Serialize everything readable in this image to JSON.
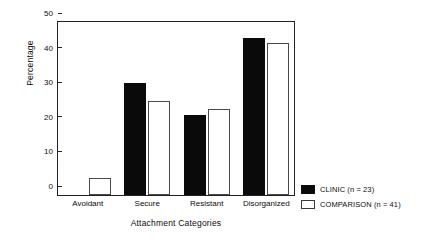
{
  "chart_data": {
    "type": "bar",
    "title": "",
    "xlabel": "Attachment Categories",
    "ylabel": "Percentage",
    "categories": [
      "Avoidant",
      "Secure",
      "Resistant",
      "Disorganized"
    ],
    "series": [
      {
        "name": "CLINIC (n = 23)",
        "color": "#0a0a0a",
        "fill": "solid",
        "values": [
          0,
          32,
          23,
          45
        ]
      },
      {
        "name": "COMPARISON (n = 41)",
        "color": "#ffffff",
        "fill": "open",
        "values": [
          5,
          27,
          24.5,
          43.5
        ]
      }
    ],
    "ylim": [
      0,
      50
    ],
    "yticks": [
      0,
      10,
      20,
      30,
      40,
      50
    ],
    "ytick_labels": [
      "0",
      "10",
      "20",
      "30",
      "40",
      "50"
    ],
    "grid": false,
    "legend_position": "bottom-right-outside",
    "frame": "box"
  },
  "legend": {
    "entries": [
      {
        "label": "CLINIC (n = 23)",
        "swatch": "filled-black-square"
      },
      {
        "label": "COMPARISON (n = 41)",
        "swatch": "open-white-square"
      }
    ]
  }
}
